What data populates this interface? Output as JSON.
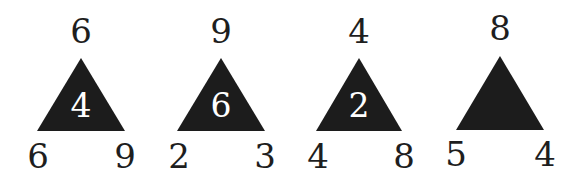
{
  "puzzle": {
    "description": "Number triangle puzzle — find the missing center value",
    "colors": {
      "triangle_fill": "#1c1c1c",
      "outer_number": "#1e1e1e",
      "inner_number": "#ffffff",
      "background": "#ffffff"
    },
    "triangles": [
      {
        "top": "6",
        "bottom_left": "6",
        "bottom_right": "9",
        "center": "4"
      },
      {
        "top": "9",
        "bottom_left": "2",
        "bottom_right": "3",
        "center": "6"
      },
      {
        "top": "4",
        "bottom_left": "4",
        "bottom_right": "8",
        "center": "2"
      },
      {
        "top": "8",
        "bottom_left": "5",
        "bottom_right": "4",
        "center": ""
      }
    ]
  }
}
